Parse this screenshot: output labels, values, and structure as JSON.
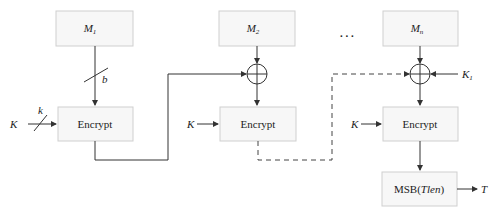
{
  "diagram": {
    "blocks": {
      "m1": {
        "base": "M",
        "sub": "1"
      },
      "m2": {
        "base": "M",
        "sub": "2"
      },
      "mn": {
        "base": "M",
        "sub": "n"
      },
      "encrypt1": "Encrypt",
      "encrypt2": "Encrypt",
      "encrypt3": "Encrypt",
      "msb_prefix": "MSB(",
      "msb_arg": "Tlen",
      "msb_suffix": ")"
    },
    "labels": {
      "b": "b",
      "k": "k",
      "key": "K",
      "k1_base": "K",
      "k1_sub": "1",
      "output": "T",
      "ellipsis": ". . ."
    }
  }
}
